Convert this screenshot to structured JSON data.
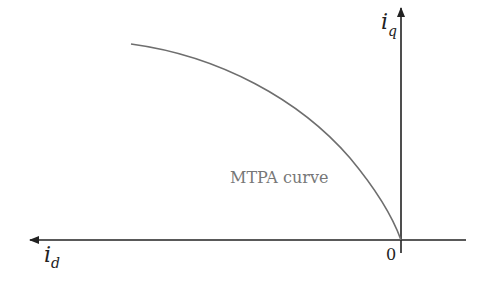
{
  "diagram": {
    "title": "",
    "axes": {
      "horizontal": {
        "label_main": "i",
        "label_sub": "d",
        "direction": "left"
      },
      "vertical": {
        "label_main": "i",
        "label_sub": "q",
        "direction": "up"
      },
      "origin_label": "0"
    },
    "curve": {
      "label": "MTPA curve",
      "color": "#6e6e6e",
      "description": "Concave curve from upper-left to origin"
    },
    "colors": {
      "axis": "#222222",
      "curve": "#6e6e6e",
      "text": "#222222",
      "curve_label": "#777777"
    }
  }
}
